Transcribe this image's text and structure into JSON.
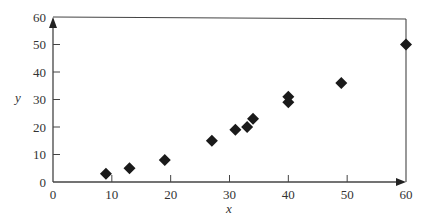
{
  "chart_data": {
    "type": "scatter",
    "title": "",
    "xlabel": "x",
    "ylabel": "y",
    "xlim": [
      0,
      60
    ],
    "ylim": [
      0,
      60
    ],
    "xticks": [
      0,
      10,
      20,
      30,
      40,
      50,
      60
    ],
    "yticks": [
      0,
      10,
      20,
      30,
      40,
      50,
      60
    ],
    "grid": false,
    "legend": null,
    "marker": "diamond",
    "marker_color": "#1a1a1a",
    "axis_color": "#444444",
    "series": [
      {
        "name": "data",
        "points": [
          {
            "x": 9,
            "y": 3
          },
          {
            "x": 13,
            "y": 5
          },
          {
            "x": 19,
            "y": 8
          },
          {
            "x": 27,
            "y": 15
          },
          {
            "x": 31,
            "y": 19
          },
          {
            "x": 33,
            "y": 20
          },
          {
            "x": 34,
            "y": 23
          },
          {
            "x": 40,
            "y": 29
          },
          {
            "x": 40,
            "y": 31
          },
          {
            "x": 49,
            "y": 36
          },
          {
            "x": 60,
            "y": 50
          }
        ]
      }
    ]
  }
}
